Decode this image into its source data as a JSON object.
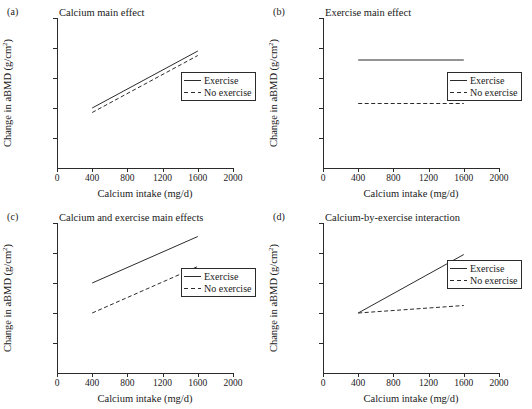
{
  "figure": {
    "axis_titles": {
      "x": "Calcium intake (mg/d)",
      "y_main": "Change in aBMD (g/cm",
      "y_sup": "2",
      "y_tail": ")"
    },
    "legend": {
      "exercise_label": "Exercise",
      "no_exercise_label": "No exercise"
    },
    "x_ticks": [
      "0",
      "400",
      "800",
      "1200",
      "1600",
      "2000"
    ],
    "line_color": "#2b2b2b"
  },
  "chart_data": [
    {
      "type": "line",
      "panel": "(a)",
      "title": "Calcium main effect",
      "xlabel": "Calcium intake (mg/d)",
      "ylabel": "Change in aBMD (g/cm2)",
      "xlim": [
        0,
        2000
      ],
      "ylim": [
        0,
        1
      ],
      "xticks": [
        0,
        400,
        800,
        1200,
        1600,
        2000
      ],
      "yticks": [
        0,
        0.2,
        0.4,
        0.6,
        0.8,
        1.0
      ],
      "ytick_labels": [],
      "grid": false,
      "legend_position": "right",
      "x": [
        400,
        1600
      ],
      "series": [
        {
          "name": "Exercise",
          "style": "solid",
          "values": [
            0.4,
            0.78
          ]
        },
        {
          "name": "No exercise",
          "style": "dashed",
          "values": [
            0.37,
            0.75
          ]
        }
      ]
    },
    {
      "type": "line",
      "panel": "(b)",
      "title": "Exercise main effect",
      "xlabel": "Calcium intake (mg/d)",
      "ylabel": "Change in aBMD (g/cm2)",
      "xlim": [
        0,
        2000
      ],
      "ylim": [
        0,
        1
      ],
      "xticks": [
        0,
        400,
        800,
        1200,
        1600,
        2000
      ],
      "yticks": [
        0,
        0.2,
        0.4,
        0.6,
        0.8,
        1.0
      ],
      "ytick_labels": [],
      "grid": false,
      "legend_position": "right",
      "x": [
        400,
        1600
      ],
      "series": [
        {
          "name": "Exercise",
          "style": "solid",
          "values": [
            0.72,
            0.72
          ]
        },
        {
          "name": "No exercise",
          "style": "dashed",
          "values": [
            0.43,
            0.43
          ]
        }
      ]
    },
    {
      "type": "line",
      "panel": "(c)",
      "title": "Calcium and exercise main effects",
      "xlabel": "Calcium intake (mg/d)",
      "ylabel": "Change in aBMD (g/cm2)",
      "xlim": [
        0,
        2000
      ],
      "ylim": [
        0,
        1
      ],
      "xticks": [
        0,
        400,
        800,
        1200,
        1600,
        2000
      ],
      "yticks": [
        0,
        0.2,
        0.4,
        0.6,
        0.8,
        1.0
      ],
      "ytick_labels": [],
      "grid": false,
      "legend_position": "right",
      "x": [
        400,
        1600
      ],
      "series": [
        {
          "name": "Exercise",
          "style": "solid",
          "values": [
            0.6,
            0.91
          ]
        },
        {
          "name": "No exercise",
          "style": "dashed",
          "values": [
            0.4,
            0.71
          ]
        }
      ]
    },
    {
      "type": "line",
      "panel": "(d)",
      "title": "Calcium-by-exercise interaction",
      "xlabel": "Calcium intake (mg/d)",
      "ylabel": "Change in aBMD (g/cm2)",
      "xlim": [
        0,
        2000
      ],
      "ylim": [
        0,
        1
      ],
      "xticks": [
        0,
        400,
        800,
        1200,
        1600,
        2000
      ],
      "yticks": [
        0,
        0.2,
        0.4,
        0.6,
        0.8,
        1.0
      ],
      "ytick_labels": [],
      "grid": false,
      "legend_position": "right",
      "x": [
        400,
        1600
      ],
      "series": [
        {
          "name": "Exercise",
          "style": "solid",
          "values": [
            0.4,
            0.79
          ]
        },
        {
          "name": "No exercise",
          "style": "dashed",
          "values": [
            0.4,
            0.45
          ]
        }
      ]
    }
  ]
}
